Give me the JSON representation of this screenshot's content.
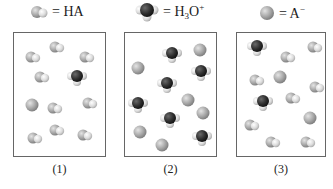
{
  "legend": [
    {
      "key": "ha",
      "label_main": "= HA",
      "sub": "",
      "sup": "",
      "icon": "ha-molecule-icon"
    },
    {
      "key": "h3o",
      "label_main": "= H",
      "sub": "3",
      "after_sub": "O",
      "sup": "+",
      "icon": "hydronium-molecule-icon"
    },
    {
      "key": "a",
      "label_main": "= A",
      "sup": "−",
      "icon": "anion-sphere-icon"
    }
  ],
  "boxes": [
    {
      "caption": "(1)",
      "left": 13,
      "width": 93,
      "molecules": [
        {
          "t": "ha",
          "x": 33,
          "y": 57
        },
        {
          "t": "ha",
          "x": 57,
          "y": 47
        },
        {
          "t": "ha",
          "x": 87,
          "y": 57
        },
        {
          "t": "ha",
          "x": 42,
          "y": 77
        },
        {
          "t": "h3o",
          "x": 77,
          "y": 78
        },
        {
          "t": "a",
          "x": 32,
          "y": 105
        },
        {
          "t": "ha",
          "x": 55,
          "y": 108
        },
        {
          "t": "ha",
          "x": 90,
          "y": 103
        },
        {
          "t": "ha",
          "x": 35,
          "y": 138
        },
        {
          "t": "ha",
          "x": 57,
          "y": 130
        },
        {
          "t": "ha",
          "x": 85,
          "y": 135
        }
      ]
    },
    {
      "caption": "(2)",
      "left": 124,
      "width": 93,
      "molecules": [
        {
          "t": "h3o",
          "x": 172,
          "y": 55
        },
        {
          "t": "a",
          "x": 200,
          "y": 50
        },
        {
          "t": "a",
          "x": 138,
          "y": 68
        },
        {
          "t": "h3o",
          "x": 201,
          "y": 73
        },
        {
          "t": "h3o",
          "x": 167,
          "y": 85
        },
        {
          "t": "a",
          "x": 188,
          "y": 100
        },
        {
          "t": "h3o",
          "x": 138,
          "y": 105
        },
        {
          "t": "a",
          "x": 203,
          "y": 113
        },
        {
          "t": "h3o",
          "x": 170,
          "y": 120
        },
        {
          "t": "a",
          "x": 140,
          "y": 132
        },
        {
          "t": "a",
          "x": 162,
          "y": 145
        },
        {
          "t": "h3o",
          "x": 202,
          "y": 138
        }
      ]
    },
    {
      "caption": "(3)",
      "left": 236,
      "width": 90,
      "molecules": [
        {
          "t": "h3o",
          "x": 257,
          "y": 48
        },
        {
          "t": "ha",
          "x": 315,
          "y": 47
        },
        {
          "t": "ha",
          "x": 288,
          "y": 57
        },
        {
          "t": "ha",
          "x": 257,
          "y": 80
        },
        {
          "t": "a",
          "x": 280,
          "y": 77
        },
        {
          "t": "ha",
          "x": 317,
          "y": 87
        },
        {
          "t": "h3o",
          "x": 263,
          "y": 103
        },
        {
          "t": "ha",
          "x": 293,
          "y": 98
        },
        {
          "t": "a",
          "x": 310,
          "y": 118
        },
        {
          "t": "ha",
          "x": 252,
          "y": 125
        },
        {
          "t": "ha",
          "x": 273,
          "y": 142
        },
        {
          "t": "ha",
          "x": 308,
          "y": 142
        }
      ]
    }
  ],
  "colors": {
    "a": "#a8a8a8",
    "ha_big": "#b8b8b8",
    "h": "#e6e6e6",
    "o": "#2e2e2e",
    "border": "#666666"
  }
}
